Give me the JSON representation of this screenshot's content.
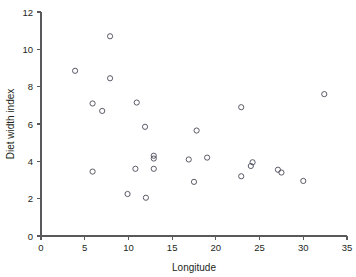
{
  "chart_data": {
    "type": "scatter",
    "title": "",
    "xlabel": "Longitude",
    "ylabel": "Diet width index",
    "xlim": [
      0,
      35
    ],
    "ylim": [
      0,
      12
    ],
    "xticks": [
      0,
      5,
      10,
      15,
      20,
      25,
      30,
      35
    ],
    "yticks": [
      0,
      2,
      4,
      6,
      8,
      10,
      12
    ],
    "xtick_labels": [
      "0",
      "5",
      "10",
      "15",
      "20",
      "25",
      "30",
      "35"
    ],
    "ytick_labels": [
      "0",
      "2",
      "4",
      "6",
      "8",
      "10",
      "12"
    ],
    "grid": false,
    "legend": null,
    "marker": "open-circle",
    "marker_color": "#4a4a58",
    "point_count": 30,
    "x": [
      3.9,
      5.9,
      5.9,
      7.0,
      7.9,
      7.9,
      9.9,
      10.8,
      10.9,
      11.9,
      12.0,
      12.8,
      12.9,
      12.9,
      17.0,
      17.5,
      17.8,
      19.0,
      22.9,
      22.9,
      24.0,
      24.2,
      27.1,
      27.5,
      30.0,
      32.4,
      13.0,
      6.0,
      11.0,
      18.0
    ],
    "y": [
      8.85,
      7.1,
      3.45,
      6.7,
      10.7,
      8.45,
      2.25,
      3.6,
      7.15,
      5.85,
      2.05,
      4.3,
      4.2,
      3.6,
      4.1,
      2.9,
      5.65,
      4.2,
      6.9,
      3.2,
      3.75,
      3.95,
      3.55,
      3.4,
      2.95,
      7.6,
      4.25,
      7.1,
      7.15,
      5.65
    ],
    "points": [
      {
        "x": 3.9,
        "y": 8.85
      },
      {
        "x": 5.9,
        "y": 7.1
      },
      {
        "x": 5.9,
        "y": 3.45
      },
      {
        "x": 7.0,
        "y": 6.7
      },
      {
        "x": 7.9,
        "y": 10.7
      },
      {
        "x": 7.9,
        "y": 8.45
      },
      {
        "x": 9.9,
        "y": 2.25
      },
      {
        "x": 10.8,
        "y": 3.6
      },
      {
        "x": 10.95,
        "y": 7.15
      },
      {
        "x": 11.9,
        "y": 5.85
      },
      {
        "x": 12.0,
        "y": 2.05
      },
      {
        "x": 12.9,
        "y": 4.3
      },
      {
        "x": 12.9,
        "y": 4.15
      },
      {
        "x": 12.9,
        "y": 3.6
      },
      {
        "x": 16.9,
        "y": 4.1
      },
      {
        "x": 17.5,
        "y": 2.9
      },
      {
        "x": 17.8,
        "y": 5.65
      },
      {
        "x": 19.0,
        "y": 4.2
      },
      {
        "x": 22.9,
        "y": 6.9
      },
      {
        "x": 22.9,
        "y": 3.2
      },
      {
        "x": 24.0,
        "y": 3.75
      },
      {
        "x": 24.2,
        "y": 3.95
      },
      {
        "x": 27.1,
        "y": 3.55
      },
      {
        "x": 27.5,
        "y": 3.4
      },
      {
        "x": 30.0,
        "y": 2.95
      },
      {
        "x": 32.4,
        "y": 7.6
      }
    ]
  },
  "axes": {
    "x_title": "Longitude",
    "y_title": "Diet width index"
  },
  "colors": {
    "axis": "#59595b",
    "text": "#231f20",
    "marker": "#4a4a58",
    "background": "#ffffff"
  }
}
